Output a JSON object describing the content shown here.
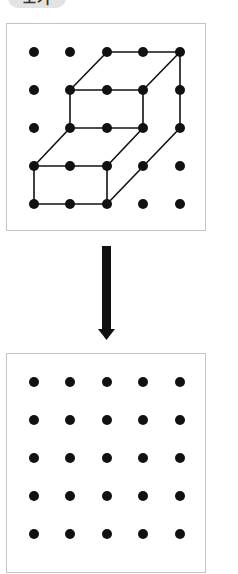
{
  "badge": {
    "label": "보기"
  },
  "colors": {
    "dot": "#111111",
    "line": "#111111",
    "panel_border": "#c4c4c4",
    "badge_bg": "#e3e3e3",
    "arrow": "#111111"
  },
  "grid": {
    "columns": 5,
    "rows": 5,
    "col_x": [
      27,
      63,
      100,
      136,
      173
    ],
    "row_y": [
      28,
      66,
      104,
      142,
      180
    ],
    "dot_radius": 5
  },
  "top_figure": {
    "description": "3D stepped block drawn on 5x5 dot grid",
    "edges": [
      [
        [
          2,
          0
        ],
        [
          4,
          0
        ]
      ],
      [
        [
          1,
          1
        ],
        [
          2,
          0
        ]
      ],
      [
        [
          3,
          1
        ],
        [
          4,
          0
        ]
      ],
      [
        [
          4,
          0
        ],
        [
          4,
          2
        ]
      ],
      [
        [
          1,
          1
        ],
        [
          3,
          1
        ]
      ],
      [
        [
          1,
          1
        ],
        [
          1,
          2
        ]
      ],
      [
        [
          3,
          1
        ],
        [
          3,
          2
        ]
      ],
      [
        [
          1,
          2
        ],
        [
          3,
          2
        ]
      ],
      [
        [
          0,
          3
        ],
        [
          1,
          2
        ]
      ],
      [
        [
          2,
          3
        ],
        [
          3,
          2
        ]
      ],
      [
        [
          4,
          2
        ],
        [
          2,
          4
        ]
      ],
      [
        [
          0,
          3
        ],
        [
          2,
          3
        ]
      ],
      [
        [
          0,
          3
        ],
        [
          0,
          4
        ]
      ],
      [
        [
          2,
          3
        ],
        [
          2,
          4
        ]
      ],
      [
        [
          0,
          4
        ],
        [
          2,
          4
        ]
      ]
    ]
  },
  "bottom_figure": {
    "description": "Empty 5x5 dot grid",
    "edges": []
  },
  "arrow": {
    "direction": "down"
  }
}
